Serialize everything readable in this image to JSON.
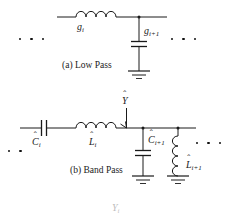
{
  "figure": {
    "type": "circuit-diagram",
    "background_color": "#ffffff",
    "line_color": "#1a1a1a"
  },
  "sections": {
    "low_pass": {
      "caption": "(a) Low Pass",
      "series_inductor_label": "g",
      "series_inductor_sub": "i",
      "shunt_capacitor_label": "g",
      "shunt_capacitor_sub": "i+1",
      "left_ellipsis_dots": 3,
      "right_ellipsis_dots": 3
    },
    "band_pass": {
      "caption": "(b) Band Pass",
      "series_capacitor_label": "C",
      "series_capacitor_sub": "i",
      "series_inductor_label": "L",
      "series_inductor_sub": "i",
      "shunt_capacitor_label": "C",
      "shunt_capacitor_sub": "i+1",
      "shunt_inductor_label": "L",
      "shunt_inductor_sub": "i+1",
      "admittance_label": "Y",
      "left_ellipsis_dots": 2,
      "right_ellipsis_dots": 3
    }
  },
  "annotations": {
    "hat_accent": "ˆ",
    "bottom_label": "Y",
    "bottom_label_sub": "i"
  }
}
